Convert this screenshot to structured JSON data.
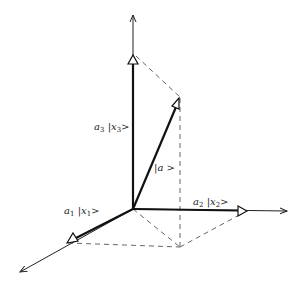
{
  "diagram": {
    "type": "3d-vector-decomposition",
    "origin": {
      "x": 133,
      "y": 209
    },
    "axes": [
      {
        "id": "x1",
        "end": {
          "x": 20,
          "y": 272
        }
      },
      {
        "id": "x2",
        "end": {
          "x": 287,
          "y": 211
        }
      },
      {
        "id": "x3",
        "end": {
          "x": 133,
          "y": 15
        }
      }
    ],
    "components": [
      {
        "id": "a1",
        "tip": {
          "x": 68,
          "y": 242
        },
        "coef": "a",
        "coef_sub": "1",
        "ket": "x",
        "ket_sub": "1"
      },
      {
        "id": "a2",
        "tip": {
          "x": 247,
          "y": 211
        },
        "coef": "a",
        "coef_sub": "2",
        "ket": "x",
        "ket_sub": "2"
      },
      {
        "id": "a3",
        "tip": {
          "x": 133,
          "y": 55
        },
        "coef": "a",
        "coef_sub": "3",
        "ket": "x",
        "ket_sub": "3"
      }
    ],
    "vector": {
      "id": "a",
      "tip": {
        "x": 179,
        "y": 98
      },
      "label": "a"
    },
    "labels": {
      "bar": "|",
      "ket_close": ">"
    },
    "colors": {
      "line": "#222222",
      "dash": "#555555",
      "background": "#ffffff"
    }
  }
}
